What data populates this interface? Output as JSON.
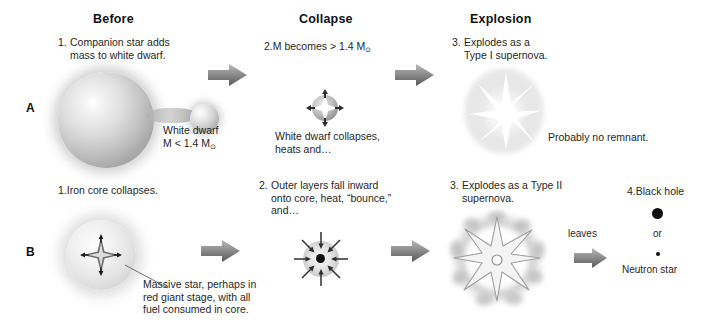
{
  "figure": {
    "background_color": "#ffffff",
    "ink_color": "#1a1a1a"
  },
  "columns": [
    {
      "id": "before",
      "label": "Before"
    },
    {
      "id": "collapse",
      "label": "Collapse"
    },
    {
      "id": "explosion",
      "label": "Explosion"
    }
  ],
  "rows": [
    {
      "id": "A",
      "letter": "A",
      "name": "Type I supernova pathway",
      "steps": [
        {
          "number": "1.",
          "text": "Companion star adds\nmass to white dwarf."
        },
        {
          "number": "2.",
          "text": "M becomes > 1.4 M"
        },
        {
          "number": "3.",
          "text": "Explodes as a\nType I supernova."
        }
      ],
      "captions": [
        {
          "id": "white-dwarf-mass",
          "text": "White dwarf\nM < 1.4 M"
        },
        {
          "id": "white-dwarf-collapse",
          "text": "White dwarf collapses,\nheats and…"
        },
        {
          "id": "no-remnant",
          "text": "Probably no remnant."
        }
      ],
      "solar_symbol": "⊙"
    },
    {
      "id": "B",
      "letter": "B",
      "name": "Type II supernova pathway",
      "steps": [
        {
          "number": "1.",
          "text": "Iron core collapses."
        },
        {
          "number": "2.",
          "text": "Outer layers fall inward\nonto core, heat, “bounce,”\nand…"
        },
        {
          "number": "3.",
          "text": "Explodes as a Type II\nsupernova."
        },
        {
          "number": "4.",
          "text": "Black hole"
        }
      ],
      "captions": [
        {
          "id": "massive-star",
          "text": "Massive star, perhaps in\nred giant stage, with all\nfuel consumed in core."
        }
      ],
      "leaves_label": "leaves",
      "remnants": {
        "black_hole_label": "Black hole",
        "or_label": "or",
        "neutron_star_label": "Neutron star"
      }
    }
  ]
}
